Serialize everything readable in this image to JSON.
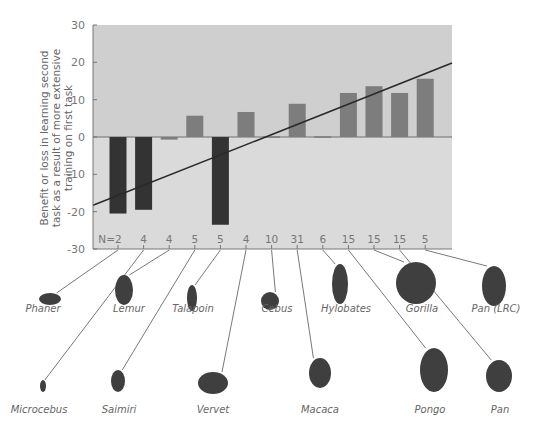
{
  "chart_data": {
    "type": "bar",
    "title": "",
    "xlabel": "",
    "ylabel": "Benefit or loss in learning second task as a result of more extensive training on first task",
    "ylabel_lines": [
      "Benefit or loss in learning second",
      "task as a result of more extensive",
      "training on first task"
    ],
    "ylim": [
      -30,
      30
    ],
    "yticks": [
      30,
      20,
      10,
      0,
      -10,
      -20,
      -30
    ],
    "grid": false,
    "legend": null,
    "categories": [
      "Phaner",
      "Microcebus",
      "Lemur",
      "Saimiri",
      "Talapoin",
      "Vervet",
      "Cebus",
      "Macaca",
      "Hylobates",
      "Pongo",
      "Gorilla",
      "Pan",
      "Pan (LRC)"
    ],
    "n_labels": [
      "N=2",
      "4",
      "4",
      "5",
      "5",
      "4",
      "10",
      "31",
      "6",
      "15",
      "15",
      "15",
      "5"
    ],
    "values": [
      -20.5,
      -19.5,
      -0.7,
      5.7,
      -23.5,
      6.7,
      0.2,
      8.9,
      0.2,
      11.8,
      13.6,
      11.8,
      15.6
    ],
    "trend_line": {
      "x_start_value": -18.3,
      "x_end_value": 19.8
    },
    "colors": {
      "positive_bar": "#7d7d7d",
      "negative_bar": "#333333",
      "plot_bg_upper": "#cfcfcf",
      "plot_bg_lower": "#dadada",
      "trend_line": "#2a2a2a",
      "axis": "#777777"
    }
  },
  "animals": {
    "top_row": [
      {
        "name": "Phaner",
        "x": 43,
        "y": 309
      },
      {
        "name": "Lemur",
        "x": 129,
        "y": 309
      },
      {
        "name": "Talapoin",
        "x": 193,
        "y": 309
      },
      {
        "name": "Cebus",
        "x": 277,
        "y": 309
      },
      {
        "name": "Hylobates",
        "x": 346,
        "y": 309
      },
      {
        "name": "Gorilla",
        "x": 422,
        "y": 309
      },
      {
        "name": "Pan (LRC)",
        "x": 496,
        "y": 309
      }
    ],
    "bottom_row": [
      {
        "name": "Microcebus",
        "x": 39,
        "y": 410
      },
      {
        "name": "Saimiri",
        "x": 119,
        "y": 410
      },
      {
        "name": "Vervet",
        "x": 213,
        "y": 410
      },
      {
        "name": "Macaca",
        "x": 320,
        "y": 410
      },
      {
        "name": "Pongo",
        "x": 430,
        "y": 410
      },
      {
        "name": "Pan",
        "x": 500,
        "y": 410
      }
    ]
  }
}
